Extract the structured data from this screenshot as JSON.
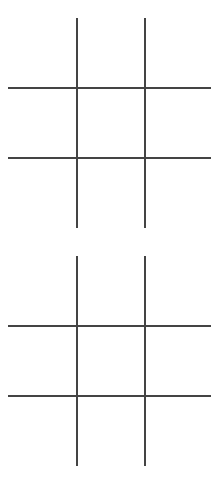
{
  "line_color": "#444444",
  "boards": [
    {
      "name": "board-1",
      "cells": [
        "",
        "",
        "",
        "",
        "",
        "",
        "",
        "",
        ""
      ]
    },
    {
      "name": "board-2",
      "cells": [
        "",
        "",
        "",
        "",
        "",
        "",
        "",
        "",
        ""
      ]
    }
  ]
}
